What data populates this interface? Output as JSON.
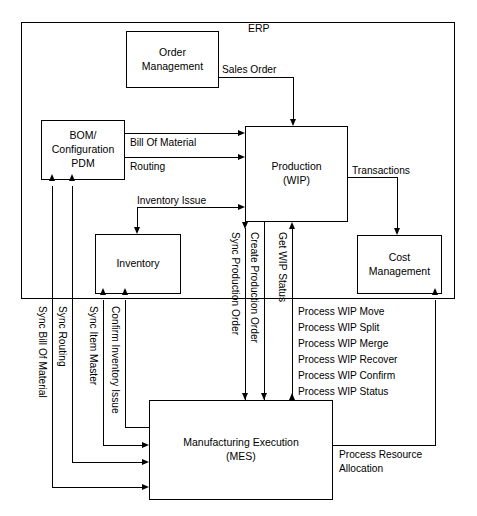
{
  "diagram": {
    "container_label": "ERP",
    "boxes": {
      "order_management": "Order\nManagement",
      "order_management_line1": "Order",
      "order_management_line2": "Management",
      "bom": "BOM/\nConfiguration\nPDM",
      "bom_line1": "BOM/",
      "bom_line2": "Configuration",
      "bom_line3": "PDM",
      "production_line1": "Production",
      "production_line2": "(WIP)",
      "inventory": "Inventory",
      "cost_management_line1": "Cost",
      "cost_management_line2": "Management",
      "mes_line1": "Manufacturing Execution",
      "mes_line2": "(MES)"
    },
    "flow_labels": {
      "sales_order": "Sales Order",
      "bill_of_material": "Bill Of Material",
      "routing": "Routing",
      "inventory_issue": "Inventory Issue",
      "transactions": "Transactions",
      "sync_production_order": "Sync Production Order",
      "create_production_order": "Create Production Order",
      "get_wip_status": "Get WIP Status",
      "sync_bill_of_material": "Sync Bill Of Material",
      "sync_routing": "Sync Routing",
      "sync_item_master": "Sync Item Master",
      "confirm_inventory_issue": "Confirm Inventory Issue",
      "process_resource_allocation_line1": "Process Resource",
      "process_resource_allocation_line2": "Allocation"
    },
    "wip_messages": [
      "Process WIP Move",
      "Process WIP Split",
      "Process WIP Merge",
      "Process WIP Recover",
      "Process WIP Confirm",
      "Process WIP Status"
    ],
    "colors": {
      "background": "#ffffff",
      "stroke": "#000000",
      "text": "#000000"
    }
  }
}
